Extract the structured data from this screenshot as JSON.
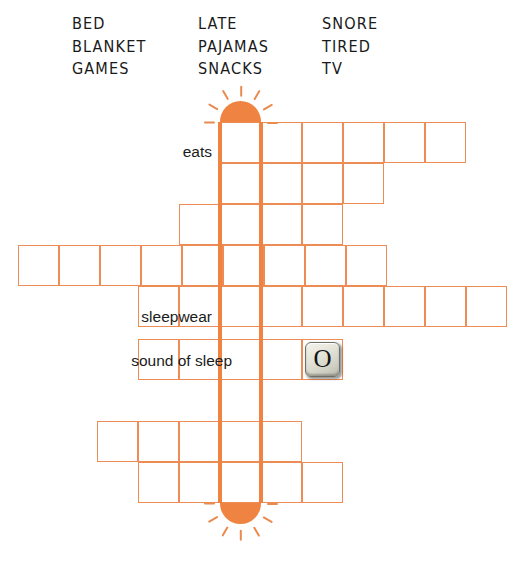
{
  "puzzle": {
    "title": "Bedtime crossword",
    "colors": {
      "grid_line": "#EE8C56",
      "accent": "#EF8341",
      "ray": "#E98A4E",
      "text": "#1a1a1a"
    }
  },
  "word_bank": {
    "columns": [
      {
        "words": [
          "BED",
          "BLANKET",
          "GAMES"
        ]
      },
      {
        "words": [
          "LATE",
          "PAJAMAS",
          "SNACKS"
        ]
      },
      {
        "words": [
          "SNORE",
          "TIRED",
          "TV"
        ]
      }
    ]
  },
  "clues": [
    {
      "id": "clue-eats",
      "label": "eats"
    },
    {
      "id": "clue-sleepwear",
      "label": "sleepwear"
    },
    {
      "id": "clue-sound-of-sleep",
      "label": "sound of sleep"
    }
  ],
  "prefilled": [
    {
      "letter": "O",
      "row": 6,
      "col": 5
    }
  ],
  "grid": {
    "cell_size": 41,
    "rows": [
      {
        "index": 1,
        "x": 220,
        "y": 122,
        "cells": 6
      },
      {
        "index": 2,
        "x": 220,
        "y": 163,
        "cells": 4
      },
      {
        "index": 3,
        "x": 179,
        "y": 204,
        "cells": 4
      },
      {
        "index": 4,
        "x": 18,
        "y": 245,
        "cells": 9
      },
      {
        "index": 5,
        "x": 138,
        "y": 286,
        "cells": 9
      },
      {
        "index": 6,
        "x": 138,
        "y": 339,
        "cells": 5
      },
      {
        "index": 7,
        "x": 97,
        "y": 421,
        "cells": 5
      },
      {
        "index": 8,
        "x": 138,
        "y": 462,
        "cells": 5
      }
    ],
    "thermometer": {
      "x_left": 220,
      "x_right": 261,
      "y_top": 122,
      "y_bottom": 503,
      "cap_radius": 21,
      "ray_count": 7
    }
  },
  "icons": {
    "sun_top": "sun-icon",
    "sun_bottom": "sun-icon"
  }
}
